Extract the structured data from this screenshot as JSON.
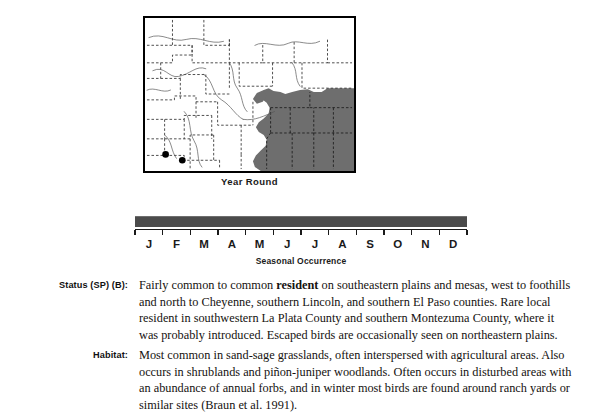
{
  "map": {
    "caption": "Year Round",
    "region_name": "Colorado",
    "shading_color": "#6e6e6e",
    "border_color": "#000000",
    "county_line_style": "dashed",
    "point_markers": [
      {
        "name": "la-plata-record",
        "x": 21,
        "y": 87
      },
      {
        "name": "montezuma-record",
        "x": 33,
        "y": 91
      }
    ]
  },
  "seasonal": {
    "caption": "Seasonal Occurrence",
    "months": [
      "J",
      "F",
      "M",
      "A",
      "M",
      "J",
      "J",
      "A",
      "S",
      "O",
      "N",
      "D"
    ],
    "bar_color": "#4b4b4b",
    "bar_start_month": "J",
    "bar_end_month": "D",
    "bar_coverage_percent": 100
  },
  "entries": [
    {
      "label": "Status (SP) (B):",
      "text_before_bold": "Fairly common to common ",
      "bold_word": "resident",
      "text_after_bold": " on southeastern plains and mesas, west to foothills and north to Cheyenne, southern Lincoln, and southern El Paso counties. Rare local resident in southwestern La Plata County and southern Montezuma County, where it was probably introduced. Escaped birds are occasionally seen on northeastern plains."
    },
    {
      "label": "Habitat:",
      "text": "Most common in sand-sage grasslands, often interspersed with agricultural areas. Also occurs in shrublands and piñon-juniper woodlands. Often occurs in disturbed areas with an abundance of annual forbs, and in winter most birds are found around ranch yards or similar sites (Braun et al. 1991)."
    }
  ]
}
